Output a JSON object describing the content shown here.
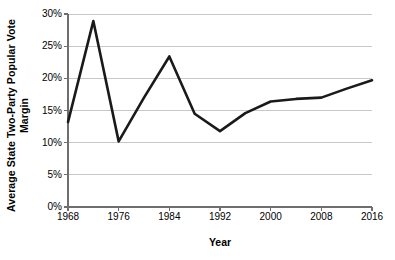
{
  "chart_data": {
    "type": "line",
    "title": "",
    "xlabel": "Year",
    "ylabel": "Average State Two-Party Popular Vote Margin",
    "ylabel_lines": [
      "Average State Two-Party Popular Vote",
      "Margin"
    ],
    "x": [
      1968,
      1972,
      1976,
      1980,
      1984,
      1988,
      1992,
      1996,
      2000,
      2004,
      2008,
      2012,
      2016
    ],
    "values": [
      13.2,
      28.9,
      10.2,
      17.0,
      23.4,
      14.5,
      11.8,
      14.6,
      16.4,
      16.8,
      17.0,
      18.4,
      19.7
    ],
    "series": [
      {
        "name": "Average State Two-Party Popular Vote Margin",
        "values": [
          13.2,
          28.9,
          10.2,
          17.0,
          23.4,
          14.5,
          11.8,
          14.6,
          16.4,
          16.8,
          17.0,
          18.4,
          19.7
        ]
      }
    ],
    "xlim": [
      1968,
      2016
    ],
    "ylim": [
      0,
      30
    ],
    "x_ticks": [
      1968,
      1976,
      1984,
      1992,
      2000,
      2008,
      2016
    ],
    "x_tick_labels": [
      "1968",
      "1976",
      "1984",
      "1992",
      "2000",
      "2008",
      "2016"
    ],
    "y_ticks": [
      0,
      5,
      10,
      15,
      20,
      25,
      30
    ],
    "y_tick_labels": [
      "0%",
      "5%",
      "10%",
      "15%",
      "20%",
      "25%",
      "30%"
    ],
    "grid": "horizontal",
    "legend": "none",
    "line_color": "#1a1a1a",
    "line_width": 2.6,
    "grid_color": "#c8c8c8",
    "axis_color": "#6e6e6e",
    "background_color": "#ffffff"
  }
}
